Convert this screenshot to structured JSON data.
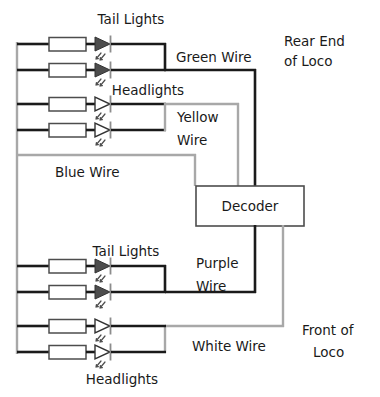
{
  "diagram": {
    "type": "circuit-schematic",
    "colors": {
      "wire_dark": "#1a1a1a",
      "wire_gray": "#a8a8a8",
      "led_filled": "#4d4d4d",
      "led_hollow": "#ffffff",
      "resistor_fill": "#ffffff",
      "box_stroke": "#4d4d4d",
      "text": "#1a1a1a",
      "background": "#ffffff"
    },
    "labels": {
      "tail_lights_rear": "Tail Lights",
      "headlights_rear": "Headlights",
      "green_wire": "Green Wire",
      "yellow_wire_line1": "Yellow",
      "yellow_wire_line2": "Wire",
      "blue_wire": "Blue Wire",
      "rear_end_line1": "Rear End",
      "rear_end_line2": "of Loco",
      "decoder": "Decoder",
      "tail_lights_front": "Tail Lights",
      "purple_wire_line1": "Purple",
      "purple_wire_line2": "Wire",
      "white_wire": "White Wire",
      "headlights_front": "Headlights",
      "front_end_line1": "Front of",
      "front_end_line2": "Loco"
    },
    "components": {
      "decoder_box": {
        "label": "Decoder"
      },
      "resistor_count": 8,
      "led_count": 8,
      "led_tail_rear": 2,
      "led_head_rear": 2,
      "led_tail_front": 2,
      "led_head_front": 2
    },
    "wires": [
      {
        "name": "Green Wire",
        "style": "dark",
        "connects": "rear tail lights to decoder"
      },
      {
        "name": "Yellow Wire",
        "style": "gray",
        "connects": "rear headlights to decoder"
      },
      {
        "name": "Blue Wire",
        "style": "gray",
        "connects": "common positive bus to decoder"
      },
      {
        "name": "Purple Wire",
        "style": "dark",
        "connects": "decoder to front tail lights"
      },
      {
        "name": "White Wire",
        "style": "gray",
        "connects": "decoder to front headlights"
      }
    ]
  }
}
